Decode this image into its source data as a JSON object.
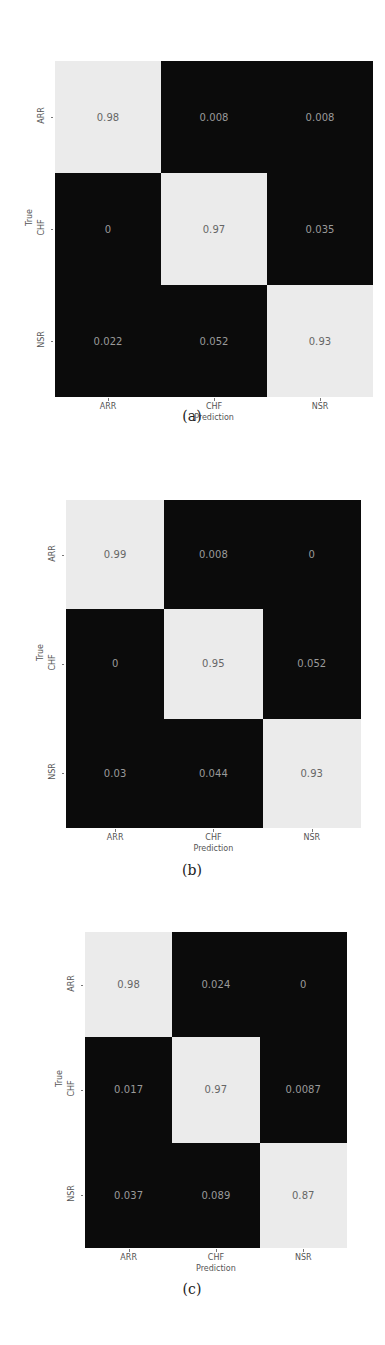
{
  "chart_data": [
    {
      "type": "heatmap",
      "title": "",
      "caption": "(a)",
      "xlabel": "Prediction",
      "ylabel": "True",
      "x_categories": [
        "ARR",
        "CHF",
        "NSR"
      ],
      "y_categories": [
        "ARR",
        "CHF",
        "NSR"
      ],
      "values": [
        [
          0.98,
          0.008,
          0.008
        ],
        [
          0,
          0.97,
          0.035
        ],
        [
          0.022,
          0.052,
          0.93
        ]
      ],
      "labels": [
        [
          "0.98",
          "0.008",
          "0.008"
        ],
        [
          "0",
          "0.97",
          "0.035"
        ],
        [
          "0.022",
          "0.052",
          "0.93"
        ]
      ],
      "colormap": "gray (dark = low, light = high)",
      "grid": false,
      "legend": "none"
    },
    {
      "type": "heatmap",
      "title": "",
      "caption": "(b)",
      "xlabel": "Prediction",
      "ylabel": "True",
      "x_categories": [
        "ARR",
        "CHF",
        "NSR"
      ],
      "y_categories": [
        "ARR",
        "CHF",
        "NSR"
      ],
      "values": [
        [
          0.99,
          0.008,
          0
        ],
        [
          0,
          0.95,
          0.052
        ],
        [
          0.03,
          0.044,
          0.93
        ]
      ],
      "labels": [
        [
          "0.99",
          "0.008",
          "0"
        ],
        [
          "0",
          "0.95",
          "0.052"
        ],
        [
          "0.03",
          "0.044",
          "0.93"
        ]
      ],
      "colormap": "gray (dark = low, light = high)",
      "grid": false,
      "legend": "none"
    },
    {
      "type": "heatmap",
      "title": "",
      "caption": "(c)",
      "xlabel": "Prediction",
      "ylabel": "True",
      "x_categories": [
        "ARR",
        "CHF",
        "NSR"
      ],
      "y_categories": [
        "ARR",
        "CHF",
        "NSR"
      ],
      "values": [
        [
          0.98,
          0.024,
          0
        ],
        [
          0.017,
          0.97,
          0.0087
        ],
        [
          0.037,
          0.089,
          0.87
        ]
      ],
      "labels": [
        [
          "0.98",
          "0.024",
          "0"
        ],
        [
          "0.017",
          "0.97",
          "0.0087"
        ],
        [
          "0.037",
          "0.089",
          "0.87"
        ]
      ],
      "colormap": "gray (dark = low, light = high)",
      "grid": false,
      "legend": "none"
    }
  ],
  "panels": [
    {
      "caption": "(a)",
      "xlabel": "Prediction",
      "ylabel": "True",
      "xticks": [
        "ARR",
        "CHF",
        "NSR"
      ],
      "yticks": [
        "ARR",
        "CHF",
        "NSR"
      ],
      "cells": [
        [
          "0.98",
          "0.008",
          "0.008"
        ],
        [
          "0",
          "0.97",
          "0.035"
        ],
        [
          "0.022",
          "0.052",
          "0.93"
        ]
      ]
    },
    {
      "caption": "(b)",
      "xlabel": "Prediction",
      "ylabel": "True",
      "xticks": [
        "ARR",
        "CHF",
        "NSR"
      ],
      "yticks": [
        "ARR",
        "CHF",
        "NSR"
      ],
      "cells": [
        [
          "0.99",
          "0.008",
          "0"
        ],
        [
          "0",
          "0.95",
          "0.052"
        ],
        [
          "0.03",
          "0.044",
          "0.93"
        ]
      ]
    },
    {
      "caption": "(c)",
      "xlabel": "Prediction",
      "ylabel": "True",
      "xticks": [
        "ARR",
        "CHF",
        "NSR"
      ],
      "yticks": [
        "ARR",
        "CHF",
        "NSR"
      ],
      "cells": [
        [
          "0.98",
          "0.024",
          "0"
        ],
        [
          "0.017",
          "0.97",
          "0.0087"
        ],
        [
          "0.037",
          "0.089",
          "0.87"
        ]
      ]
    }
  ],
  "colors": {
    "high": "#ebebeb",
    "low": "#0b0b0b",
    "text_on_light": "#666666",
    "text_on_dark": "#9a9a9a"
  }
}
